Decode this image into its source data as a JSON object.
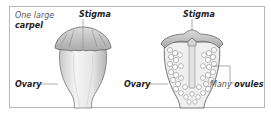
{
  "diagram": {
    "left_figure": {
      "annotation_line1": "One large",
      "annotation_line2": "carpel",
      "stigma_label": "Stigma",
      "ovary_label": "Ovary"
    },
    "right_figure": {
      "stigma_label": "Stigma",
      "ovary_label": "Ovary",
      "ovules_label_prefix": "Many",
      "ovules_label_bold": "ovules"
    },
    "colors": {
      "frame": "#b8b8b8",
      "carpel_fill": "#eaeaea",
      "carpel_shade": "#bdbdbd",
      "outline": "#555555",
      "leader_line": "#777777"
    }
  }
}
